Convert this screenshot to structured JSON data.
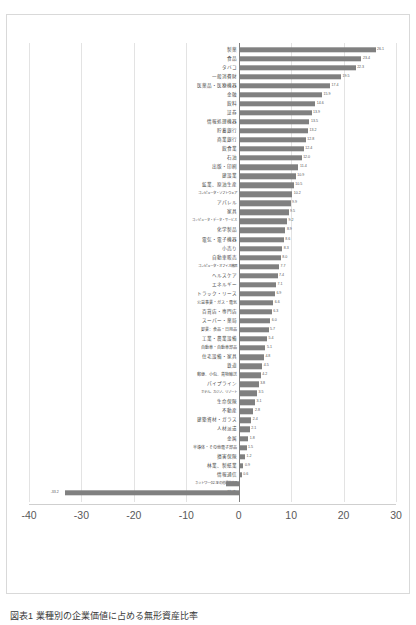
{
  "caption": "図表1 業種別の企業価値に占める無形資産比率",
  "chart_data": {
    "type": "bar",
    "orientation": "horizontal",
    "title": "",
    "xlabel": "",
    "ylabel": "",
    "xlim": [
      -40,
      30
    ],
    "xticks": [
      -40,
      -30,
      -20,
      -10,
      0,
      10,
      20,
      30
    ],
    "xtick_labels": [
      "-40",
      "-30",
      "-20",
      "-10",
      "0",
      "10",
      "20",
      "30"
    ],
    "grid": true,
    "legend": false,
    "bar_color": "#808080",
    "categories": [
      "製薬",
      "食品",
      "タバコ",
      "一般消費財",
      "医薬品・医療機器",
      "金融",
      "飲料",
      "証券",
      "情報処理機器",
      "貯蓄銀行",
      "商業銀行",
      "飲食業",
      "石油",
      "出版・印刷",
      "建設業",
      "鉱業、原油生産",
      "コンピュータ・ソフトウェア",
      "アパレル",
      "家具",
      "コンピュータ・データ・サービス",
      "化学製品",
      "電気・電子機器",
      "小売り",
      "自動車販売",
      "コンピュータ・オフィス機器",
      "ヘルスケア",
      "エネルギー",
      "トラック・リース",
      "公益事業・ガス・電気",
      "百貨店・専門店",
      "スーパー・薬局",
      "卸業：食品・日用品",
      "工業・農業設備",
      "自動車・自動車部品",
      "住宅設備・家具",
      "鉄道",
      "郵便、小包、貨物輸送",
      "パイプライン",
      "ホテル、カジノ、リゾート",
      "生命保険",
      "不動産",
      "建築資材・ガラス",
      "人材派遣",
      "金属",
      "半導体・その他電子部品",
      "損害保険",
      "林業、製紙業",
      "情報通信",
      "ネットワーク、その他通信機器",
      "航空"
    ],
    "values": [
      26.1,
      23.4,
      22.3,
      19.5,
      17.4,
      15.9,
      14.6,
      13.9,
      13.5,
      13.2,
      12.8,
      12.4,
      12.0,
      11.4,
      10.9,
      10.5,
      10.2,
      9.9,
      9.5,
      9.2,
      8.9,
      8.6,
      8.3,
      8.0,
      7.7,
      7.4,
      7.1,
      6.9,
      6.6,
      6.3,
      6.0,
      5.7,
      5.4,
      5.1,
      4.8,
      4.5,
      4.2,
      3.8,
      3.5,
      3.1,
      2.8,
      2.4,
      2.1,
      1.8,
      1.5,
      1.2,
      0.9,
      0.6,
      -2.5,
      -33.2
    ],
    "value_labels": [
      "26.1",
      "23.4",
      "22.3",
      "19.5",
      "17.4",
      "15.9",
      "14.6",
      "13.9",
      "13.5",
      "13.2",
      "12.8",
      "12.4",
      "12.0",
      "11.4",
      "10.9",
      "10.5",
      "10.2",
      "9.9",
      "9.5",
      "9.2",
      "8.9",
      "8.6",
      "8.3",
      "8.0",
      "7.7",
      "7.4",
      "7.1",
      "6.9",
      "6.6",
      "6.3",
      "6.0",
      "5.7",
      "5.4",
      "5.1",
      "4.8",
      "4.5",
      "4.2",
      "3.8",
      "3.5",
      "3.1",
      "2.8",
      "2.4",
      "2.1",
      "1.8",
      "1.5",
      "1.2",
      "0.9",
      "0.6",
      "-2.5",
      "-33.2"
    ]
  }
}
